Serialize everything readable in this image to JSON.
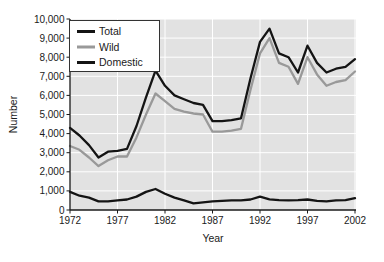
{
  "figure": {
    "background": "#ffffff"
  },
  "chart_data": {
    "type": "line",
    "title": "",
    "xlabel": "Year",
    "ylabel": "Number",
    "xlim": [
      1972,
      2002
    ],
    "ylim": [
      0,
      10000
    ],
    "xticks": [
      1972,
      1977,
      1982,
      1987,
      1992,
      1997,
      2002
    ],
    "yticks": [
      0,
      1000,
      2000,
      3000,
      4000,
      5000,
      6000,
      7000,
      8000,
      9000,
      10000
    ],
    "grid": true,
    "plot_background": "#e2e2e2",
    "grid_color": "#ffffff",
    "axis_color": "#1a1a1a",
    "text_color": "#1a1a1a",
    "legend": {
      "position": "top-left",
      "entries": [
        "Total",
        "Wild",
        "Domestic"
      ]
    },
    "draw_order": [
      "Wild",
      "Total",
      "Domestic"
    ],
    "x": [
      1972,
      1973,
      1974,
      1975,
      1976,
      1977,
      1978,
      1979,
      1980,
      1981,
      1982,
      1983,
      1984,
      1985,
      1986,
      1987,
      1988,
      1989,
      1990,
      1991,
      1992,
      1993,
      1994,
      1995,
      1996,
      1997,
      1998,
      1999,
      2000,
      2001,
      2002
    ],
    "series": [
      {
        "name": "Total",
        "color": "#141414",
        "values": [
          4300,
          3900,
          3400,
          2750,
          3050,
          3100,
          3200,
          4400,
          5900,
          7300,
          6500,
          6000,
          5800,
          5600,
          5500,
          4650,
          4650,
          4700,
          4800,
          6900,
          8800,
          9500,
          8200,
          8000,
          7200,
          8600,
          7700,
          7200,
          7400,
          7500,
          7900
        ]
      },
      {
        "name": "Wild",
        "color": "#999999",
        "values": [
          3350,
          3150,
          2750,
          2300,
          2600,
          2800,
          2800,
          3800,
          5000,
          6100,
          5700,
          5300,
          5150,
          5050,
          5000,
          4100,
          4100,
          4150,
          4250,
          6300,
          8200,
          9000,
          7700,
          7500,
          6600,
          8000,
          7100,
          6500,
          6700,
          6800,
          7250
        ]
      },
      {
        "name": "Domestic",
        "color": "#141414",
        "values": [
          950,
          750,
          650,
          450,
          450,
          500,
          550,
          700,
          950,
          1100,
          850,
          650,
          500,
          350,
          400,
          450,
          480,
          500,
          500,
          550,
          700,
          560,
          520,
          500,
          520,
          550,
          480,
          450,
          500,
          520,
          620
        ]
      }
    ]
  }
}
